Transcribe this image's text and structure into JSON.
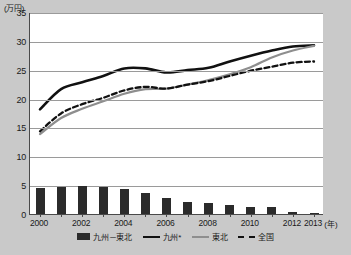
{
  "chart_data": {
    "type": "bar",
    "title": "",
    "ylabel": "(万円)",
    "xlabel": "(年)",
    "ylim": [
      0,
      35
    ],
    "yticks": [
      0,
      5,
      10,
      15,
      20,
      25,
      30,
      35
    ],
    "grid": true,
    "legend_position": "bottom",
    "x": [
      2000,
      2001,
      2002,
      2003,
      2004,
      2005,
      2006,
      2007,
      2008,
      2009,
      2010,
      2011,
      2012,
      2013
    ],
    "xtick_labels": [
      "2000",
      "2002",
      "2004",
      "2006",
      "2008",
      "2010",
      "2012",
      "2013"
    ],
    "xtick_values": [
      2000,
      2002,
      2004,
      2006,
      2008,
      2010,
      2012,
      2013
    ],
    "series": [
      {
        "name": "九州－東北",
        "type": "bar",
        "color": "#2b2b2b",
        "values": [
          4.5,
          4.6,
          4.9,
          4.75,
          4.3,
          3.65,
          2.7,
          2.1,
          1.85,
          1.5,
          1.3,
          1.15,
          0.4,
          0.1
        ]
      },
      {
        "name": "九州*",
        "type": "line",
        "style": "solid-thick",
        "color": "#111111",
        "values": [
          18.3,
          21.8,
          23.0,
          24.1,
          25.4,
          25.4,
          24.7,
          25.1,
          25.5,
          26.6,
          27.6,
          28.5,
          29.2,
          29.4
        ]
      },
      {
        "name": "東北",
        "type": "line",
        "style": "solid",
        "color": "#8e8e8e",
        "values": [
          14.0,
          16.8,
          18.4,
          19.7,
          21.0,
          21.8,
          21.9,
          22.6,
          23.4,
          24.4,
          25.6,
          27.3,
          28.5,
          29.3
        ]
      },
      {
        "name": "全国",
        "type": "line",
        "style": "dashed",
        "color": "#111111",
        "values": [
          14.5,
          17.6,
          19.2,
          20.3,
          21.6,
          22.2,
          21.9,
          22.6,
          23.2,
          24.1,
          25.0,
          25.7,
          26.4,
          26.6
        ]
      }
    ]
  },
  "legend": {
    "items": [
      {
        "label": "九州－東北",
        "swatch": "bar-swatch"
      },
      {
        "label": "九州*",
        "swatch": "solid-black-line-swatch"
      },
      {
        "label": "東北",
        "swatch": "solid-gray-line-swatch"
      },
      {
        "label": "全国",
        "swatch": "dashed-black-line-swatch"
      }
    ]
  },
  "axis": {
    "y_unit": "(万円)",
    "x_unit": "(年)"
  },
  "colors": {
    "bar": "#2b2b2b",
    "kyushu_line": "#111111",
    "tohoku_line": "#8e8e8e",
    "national_line": "#111111",
    "grid": "#9a9a9a",
    "plot_bg": "#ffffff",
    "page_bg": "#c9c9c9"
  }
}
